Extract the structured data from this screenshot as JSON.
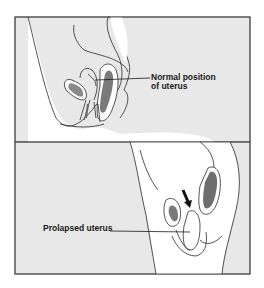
{
  "figure": {
    "colors": {
      "panel_background": "#e8e8e8",
      "body_fill": "#ffffff",
      "line": "#2a2a2a",
      "organ_shade": "#7a7a7a",
      "frame": "#555555"
    },
    "panels": [
      {
        "id": "top",
        "label_lines": [
          "Normal position",
          "of uterus"
        ]
      },
      {
        "id": "bottom",
        "label_lines": [
          "Prolapsed uterus"
        ],
        "arrow": "down-arrow"
      }
    ]
  }
}
